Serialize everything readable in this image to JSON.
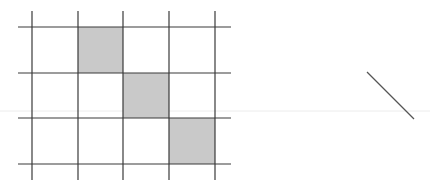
{
  "figure": {
    "grid": {
      "columns": 4,
      "rows": 3,
      "x_lines": [
        32,
        78,
        123,
        169,
        215
      ],
      "y_lines": [
        27,
        73,
        118,
        164
      ],
      "h_line_extent": [
        18,
        231
      ],
      "v_line_extent": [
        11,
        180
      ],
      "line_color": "#3a3a3a",
      "shaded_cells": [
        {
          "row": 0,
          "col": 1
        },
        {
          "row": 1,
          "col": 2
        },
        {
          "row": 2,
          "col": 3
        }
      ],
      "shade_color": "#c9c9c9"
    },
    "diagonal_segment": {
      "x1": 367,
      "y1": 72,
      "x2": 414,
      "y2": 119,
      "color": "#555555"
    },
    "scan_artifact_line": {
      "y": 111,
      "x1": 0,
      "x2": 430,
      "color": "#ececec"
    }
  }
}
